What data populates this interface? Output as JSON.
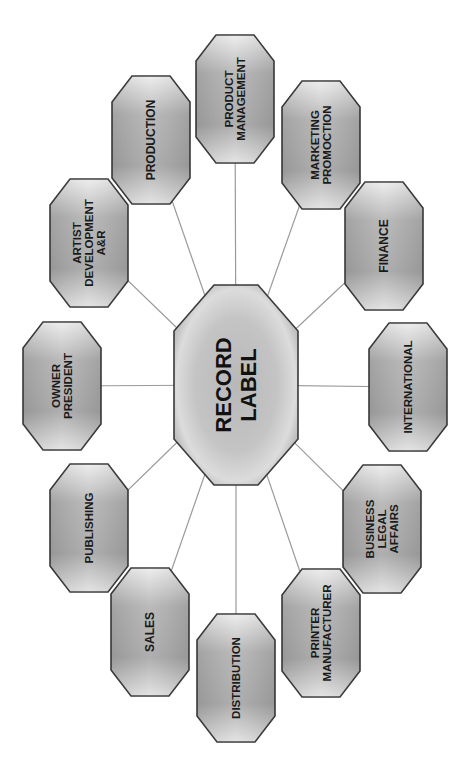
{
  "diagram": {
    "type": "hub-and-spoke",
    "orientation": "rotated -90deg (text reads bottom-to-top)",
    "center": {
      "id": "record-label",
      "lines": [
        "RECORD",
        "LABEL"
      ],
      "cx": 236,
      "cy": 385,
      "w": 124,
      "h": 200
    },
    "colors": {
      "node_fill_light": "#e6e6e6",
      "node_fill_dark": "#9c9c9c",
      "node_stroke": "#3a3a3a",
      "connector": "#9a9a9a",
      "text": "#1a1a1a",
      "background": "#ffffff"
    },
    "nodes": [
      {
        "id": "product-management",
        "lines": [
          "PRODUCT",
          "MANAGEMENT"
        ],
        "cx": 235,
        "cy": 99,
        "font": 11.5
      },
      {
        "id": "marketing-promotion",
        "lines": [
          "MARKETING",
          "PROMOCTION"
        ],
        "cx": 321,
        "cy": 145,
        "font": 11.5
      },
      {
        "id": "finance",
        "lines": [
          "FINANCE"
        ],
        "cx": 384,
        "cy": 246,
        "font": 12
      },
      {
        "id": "international",
        "lines": [
          "INTERNATIONAL"
        ],
        "cx": 408,
        "cy": 387,
        "font": 11.5
      },
      {
        "id": "business-legal-affairs",
        "lines": [
          "BUSINESS",
          "LEGAL",
          "AFFAIRS"
        ],
        "cx": 382,
        "cy": 529,
        "font": 11.5
      },
      {
        "id": "printer-manufacturer",
        "lines": [
          "PRINTER",
          "MANUFACTURER"
        ],
        "cx": 321,
        "cy": 633,
        "font": 11.5
      },
      {
        "id": "distribution",
        "lines": [
          "DISTRIBUTION"
        ],
        "cx": 236,
        "cy": 678,
        "font": 11.5
      },
      {
        "id": "sales",
        "lines": [
          "SALES"
        ],
        "cx": 150,
        "cy": 632,
        "font": 12
      },
      {
        "id": "publishing",
        "lines": [
          "PUBLISHING"
        ],
        "cx": 89,
        "cy": 528,
        "font": 11.5
      },
      {
        "id": "owner-president",
        "lines": [
          "OWNER",
          "PRESIDENT"
        ],
        "cx": 62,
        "cy": 386,
        "font": 11.5
      },
      {
        "id": "artist-development",
        "lines": [
          "ARTIST",
          "DEVELOPMENT",
          "A&R"
        ],
        "cx": 89,
        "cy": 243,
        "font": 11.5
      },
      {
        "id": "production",
        "lines": [
          "PRODUCTION"
        ],
        "cx": 151,
        "cy": 140,
        "font": 12
      }
    ],
    "node_size": {
      "w": 78,
      "h": 128
    }
  }
}
